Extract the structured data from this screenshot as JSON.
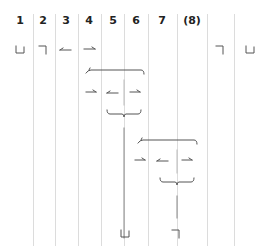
{
  "diagram": {
    "headers": [
      {
        "label": "1",
        "x": 20
      },
      {
        "label": "2",
        "x": 43
      },
      {
        "label": "3",
        "x": 66
      },
      {
        "label": "4",
        "x": 89
      },
      {
        "label": "5",
        "x": 113
      },
      {
        "label": "6",
        "x": 136
      },
      {
        "label": "7",
        "x": 162
      },
      {
        "label": "(8)",
        "x": 192
      }
    ],
    "column_dividers": [
      33,
      55,
      78,
      101,
      124,
      148,
      177,
      207,
      234
    ],
    "row1_glyphs": [
      {
        "name": "open-box-glyph",
        "x": 20,
        "y": 50
      },
      {
        "name": "corner-glyph",
        "x": 43,
        "y": 50
      },
      {
        "name": "left-arrow-glyph",
        "x": 66,
        "y": 50
      },
      {
        "name": "right-arrow-glyph",
        "x": 89,
        "y": 50
      },
      {
        "name": "corner-glyph",
        "x": 220,
        "y": 50
      },
      {
        "name": "open-box-glyph",
        "x": 250,
        "y": 50
      }
    ],
    "colors": {
      "stroke": "#555555",
      "divider": "#dcdcdc",
      "divider_dark": "#9a9a9a",
      "text": "#222222"
    }
  }
}
